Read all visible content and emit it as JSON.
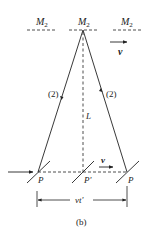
{
  "figure": {
    "caption": "(b)",
    "mirror_labels": [
      "M",
      "M",
      "M"
    ],
    "mirror_subscript": "2",
    "velocity_label": "v",
    "velocity_label_bottom": "v",
    "length_label": "L",
    "path_labels": [
      "(2)",
      "(2)"
    ],
    "point_labels": [
      "P",
      "P'",
      "P"
    ],
    "distance_label": "vt'",
    "colors": {
      "line": "#222222",
      "background": "#ffffff"
    }
  }
}
